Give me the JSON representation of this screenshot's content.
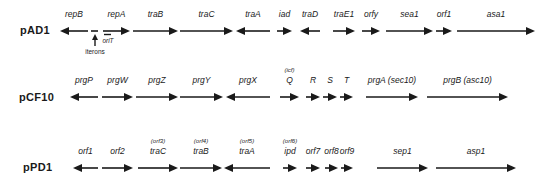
{
  "figure": {
    "rows": [
      {
        "plasmid": "pAD1",
        "label_y": 24,
        "arrow_y": 31,
        "genes": [
          {
            "name": "repB",
            "x1": 60,
            "x2": 88,
            "dir": "left"
          },
          {
            "name": "repA",
            "x1": 103,
            "x2": 130,
            "dir": "right"
          },
          {
            "name": "traB",
            "x1": 133,
            "x2": 178,
            "dir": "right"
          },
          {
            "name": "traC",
            "x1": 180,
            "x2": 233,
            "dir": "right"
          },
          {
            "name": "traA",
            "x1": 236,
            "x2": 270,
            "dir": "left"
          },
          {
            "name": "iad",
            "x1": 277,
            "x2": 292,
            "dir": "right"
          },
          {
            "name": "traD",
            "x1": 300,
            "x2": 320,
            "dir": "left"
          },
          {
            "name": "traE1",
            "x1": 333,
            "x2": 355,
            "dir": "right"
          },
          {
            "name": "orfy",
            "x1": 362,
            "x2": 380,
            "dir": "right"
          },
          {
            "name": "sea1",
            "x1": 386,
            "x2": 433,
            "dir": "right"
          },
          {
            "name": "orf1",
            "x1": 436,
            "x2": 452,
            "dir": "right"
          },
          {
            "name": "asa1",
            "x1": 457,
            "x2": 535,
            "dir": "right"
          }
        ],
        "annotations": {
          "iterons": "iterons",
          "oriT": "oriT"
        }
      },
      {
        "plasmid": "pCF10",
        "label_y": 90,
        "arrow_y": 97,
        "genes": [
          {
            "name": "prgP",
            "x1": 70,
            "x2": 98,
            "dir": "left"
          },
          {
            "name": "prgW",
            "x1": 102,
            "x2": 133,
            "dir": "right"
          },
          {
            "name": "prgZ",
            "x1": 136,
            "x2": 178,
            "dir": "right"
          },
          {
            "name": "prgY",
            "x1": 180,
            "x2": 223,
            "dir": "right"
          },
          {
            "name": "prgX",
            "x1": 226,
            "x2": 270,
            "dir": "left"
          },
          {
            "name": "Q",
            "alt": "(icf)",
            "x1": 280,
            "x2": 299,
            "dir": "right"
          },
          {
            "name": "R",
            "x1": 306,
            "x2": 320,
            "dir": "right"
          },
          {
            "name": "S",
            "x1": 323,
            "x2": 337,
            "dir": "right"
          },
          {
            "name": "T",
            "x1": 340,
            "x2": 353,
            "dir": "right"
          },
          {
            "name": "prgA (sec10)",
            "x1": 366,
            "x2": 418,
            "dir": "right"
          },
          {
            "name": "prgB (asc10)",
            "x1": 427,
            "x2": 508,
            "dir": "right"
          }
        ]
      },
      {
        "plasmid": "pPD1",
        "label_y": 158,
        "arrow_y": 168,
        "genes": [
          {
            "name": "orf1",
            "x1": 73,
            "x2": 98,
            "dir": "left"
          },
          {
            "name": "orf2",
            "x1": 102,
            "x2": 133,
            "dir": "right"
          },
          {
            "name": "traC",
            "alt": "(orf3)",
            "x1": 138,
            "x2": 178,
            "dir": "right"
          },
          {
            "name": "traB",
            "alt": "(orf4)",
            "x1": 180,
            "x2": 222,
            "dir": "right"
          },
          {
            "name": "traA",
            "alt": "(orf5)",
            "x1": 224,
            "x2": 270,
            "dir": "left"
          },
          {
            "name": "ipd",
            "alt": "(orf6)",
            "x1": 283,
            "x2": 297,
            "dir": "right"
          },
          {
            "name": "orf7",
            "x1": 306,
            "x2": 320,
            "dir": "right"
          },
          {
            "name": "orf8",
            "x1": 325,
            "x2": 338,
            "dir": "right"
          },
          {
            "name": "orf9",
            "x1": 341,
            "x2": 353,
            "dir": "right"
          },
          {
            "name": "sep1",
            "x1": 377,
            "x2": 428,
            "dir": "right"
          },
          {
            "name": "asp1",
            "x1": 436,
            "x2": 516,
            "dir": "right"
          }
        ]
      }
    ],
    "colors": {
      "ink": "#1a1a1a",
      "background": "#ffffff"
    }
  }
}
